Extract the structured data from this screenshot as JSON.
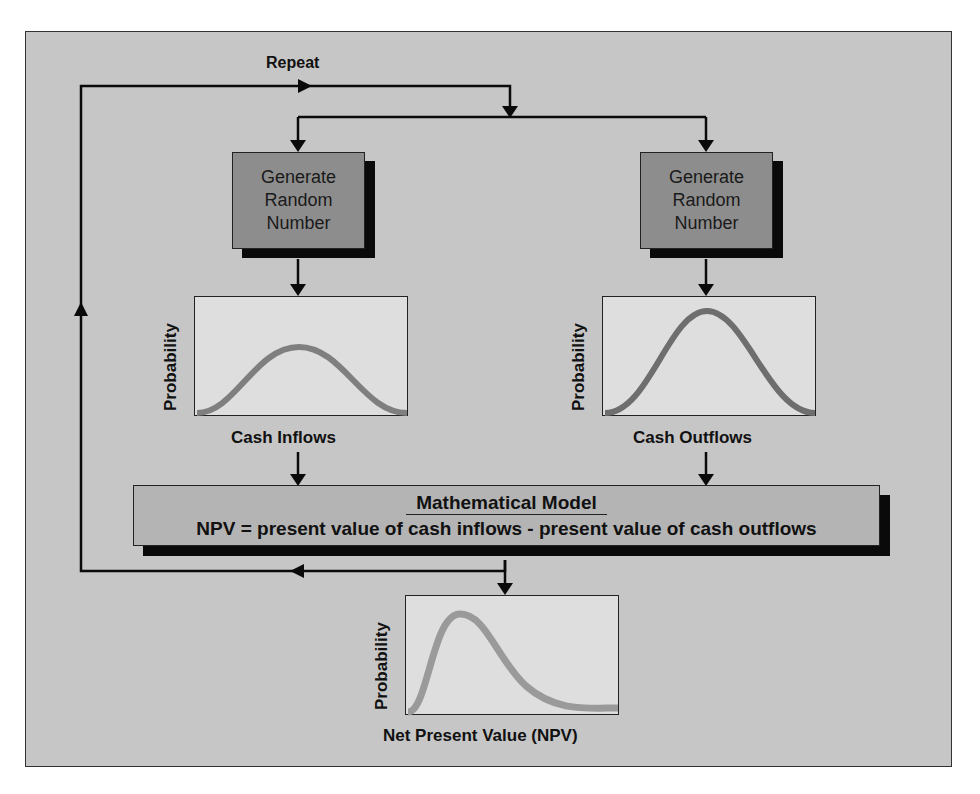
{
  "loop": {
    "label": "Repeat"
  },
  "generators": [
    {
      "lines": [
        "Generate",
        "Random",
        "Number"
      ]
    },
    {
      "lines": [
        "Generate",
        "Random",
        "Number"
      ]
    }
  ],
  "distributions": {
    "inflows": {
      "ylabel": "Probability",
      "xlabel": "Cash Inflows",
      "shape": "normal-low"
    },
    "outflows": {
      "ylabel": "Probability",
      "xlabel": "Cash Outflows",
      "shape": "normal-high"
    },
    "npv": {
      "ylabel": "Probability",
      "xlabel": "Net Present Value (NPV)",
      "shape": "right-skewed"
    }
  },
  "model": {
    "title": "Mathematical Model",
    "equation": "NPV = present value of cash inflows - present value of cash outflows"
  },
  "colors": {
    "background": "#c6c6c6",
    "generator_fill": "#8d8d8d",
    "panel_fill": "#dedede",
    "curve": "#7f7f7f",
    "curve_npv": "#9a9a9a",
    "model_fill": "#b4b4b4"
  }
}
